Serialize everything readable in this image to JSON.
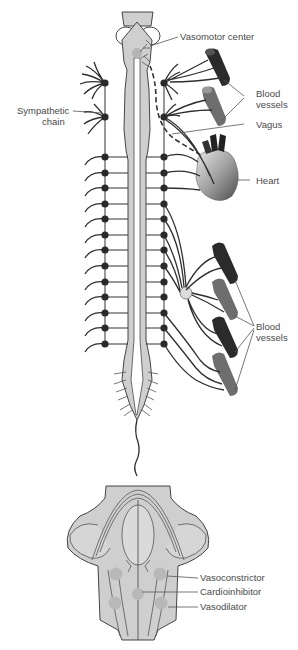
{
  "figure": {
    "type": "anatomical diagram",
    "colors": {
      "tissue": "#cfcfcf",
      "tissue_light": "#e2e2e2",
      "node": "#2a2a2a",
      "artery_dark": "#2b2b2b",
      "artery_mid": "#6e6e6e",
      "line": "#333333",
      "label": "#4a4a4a"
    }
  },
  "labels": {
    "vasomotor_center": "Vasomotor center",
    "blood_vessels_top_1": "Blood",
    "blood_vessels_top_2": "vessels",
    "sympathetic_chain_1": "Sympathetic",
    "sympathetic_chain_2": "chain",
    "vagus": "Vagus",
    "heart": "Heart",
    "blood_vessels_bottom_1": "Blood",
    "blood_vessels_bottom_2": "vessels",
    "vasoconstrictor": "Vasoconstrictor",
    "cardioinhibitor": "Cardioinhibitor",
    "vasodilator": "Vasodilator"
  },
  "sympathetic_chain": {
    "left_x": 105,
    "right_x": 164,
    "upper_ganglia_y": [
      83,
      117
    ],
    "segment_ganglia_y": [
      157,
      173,
      188,
      204,
      219,
      235,
      250,
      266,
      282,
      297,
      313,
      328,
      344
    ]
  }
}
